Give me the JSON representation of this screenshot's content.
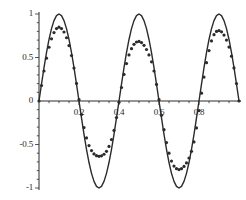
{
  "chart_data": {
    "type": "line",
    "title": "",
    "subtitle": "",
    "xlabel": "",
    "ylabel": "",
    "xlim": [
      0,
      1.0
    ],
    "ylim": [
      -1,
      1
    ],
    "grid": false,
    "legend": null,
    "legend_position": "none",
    "background_color": "#ffffff",
    "axis_color": "#2b2b2b",
    "xticks": [
      0.2,
      0.4,
      0.6,
      0.8
    ],
    "xtick_labels": [
      "0.2",
      "0.4",
      "0.6",
      "0.8"
    ],
    "xticks_minor": [
      0.05,
      0.1,
      0.15,
      0.25,
      0.3,
      0.35,
      0.45,
      0.5,
      0.55,
      0.65,
      0.7,
      0.75,
      0.85,
      0.9,
      0.95
    ],
    "yticks": [
      -1,
      -0.5,
      0,
      0.5,
      1
    ],
    "ytick_labels": [
      "-1",
      "-0.5",
      "0",
      "0.5",
      "1"
    ],
    "yticks_minor": [
      -0.9,
      -0.8,
      -0.7,
      -0.6,
      -0.4,
      -0.3,
      -0.2,
      -0.1,
      0.1,
      0.2,
      0.3,
      0.4,
      0.6,
      0.7,
      0.8,
      0.9
    ],
    "series": [
      {
        "name": "exact",
        "style": "solid",
        "color": "#2b2b2b",
        "line_width": 1.4,
        "description": "sin(4*pi*x), amplitude 1, two full periods over x in [0,1]",
        "x": [
          0,
          0.0125,
          0.025,
          0.0375,
          0.05,
          0.0625,
          0.075,
          0.0875,
          0.1,
          0.1125,
          0.125,
          0.1375,
          0.15,
          0.1625,
          0.175,
          0.1875,
          0.2,
          0.2125,
          0.225,
          0.2375,
          0.25,
          0.2625,
          0.275,
          0.2875,
          0.3,
          0.3125,
          0.325,
          0.3375,
          0.35,
          0.3625,
          0.375,
          0.3875,
          0.4,
          0.4125,
          0.425,
          0.4375,
          0.45,
          0.4625,
          0.475,
          0.4875,
          0.5,
          0.5125,
          0.525,
          0.5375,
          0.55,
          0.5625,
          0.575,
          0.5875,
          0.6,
          0.6125,
          0.625,
          0.6375,
          0.65,
          0.6625,
          0.675,
          0.6875,
          0.7,
          0.7125,
          0.725,
          0.7375,
          0.75,
          0.7625,
          0.775,
          0.7875,
          0.8,
          0.8125,
          0.825,
          0.8375,
          0.85,
          0.8625,
          0.875,
          0.8875,
          0.9,
          0.9125,
          0.925,
          0.9375,
          0.95,
          0.9625,
          0.975,
          0.9875,
          1.0
        ],
        "y": [
          0,
          0.1951,
          0.3827,
          0.5556,
          0.7071,
          0.8315,
          0.9239,
          0.9808,
          1.0,
          0.9808,
          0.9239,
          0.8315,
          0.7071,
          0.5556,
          0.3827,
          0.1951,
          0,
          -0.1951,
          -0.3827,
          -0.5556,
          -0.7071,
          -0.8315,
          -0.9239,
          -0.9808,
          -1.0,
          -0.9808,
          -0.9239,
          -0.8315,
          -0.7071,
          -0.5556,
          -0.3827,
          -0.1951,
          0,
          0.1951,
          0.3827,
          0.5556,
          0.7071,
          0.8315,
          0.9239,
          0.9808,
          1.0,
          0.9808,
          0.9239,
          0.8315,
          0.7071,
          0.5556,
          0.3827,
          0.1951,
          0,
          -0.1951,
          -0.3827,
          -0.5556,
          -0.7071,
          -0.8315,
          -0.9239,
          -0.9808,
          -1.0,
          -0.9808,
          -0.9239,
          -0.8315,
          -0.7071,
          -0.5556,
          -0.3827,
          -0.1951,
          0,
          0.1951,
          0.3827,
          0.5556,
          0.7071,
          0.8315,
          0.9239,
          0.9808,
          1.0,
          0.9808,
          0.9239,
          0.8315,
          0.7071,
          0.5556,
          0.3827,
          0.1951,
          0
        ]
      },
      {
        "name": "approximation",
        "style": "dotted",
        "color": "#2b2b2b",
        "marker_size": 1.6,
        "description": "damped sine approximation, amplitude decreasing: peaks ~0.85 then ~0.67; troughs ~-0.63 then ~-0.78",
        "x": [
          0,
          0.0125,
          0.025,
          0.0375,
          0.05,
          0.0625,
          0.075,
          0.0875,
          0.1,
          0.1125,
          0.125,
          0.1375,
          0.15,
          0.1625,
          0.175,
          0.1875,
          0.2,
          0.2125,
          0.225,
          0.2375,
          0.25,
          0.2625,
          0.275,
          0.2875,
          0.3,
          0.3125,
          0.325,
          0.3375,
          0.35,
          0.3625,
          0.375,
          0.3875,
          0.4,
          0.4125,
          0.425,
          0.4375,
          0.45,
          0.4625,
          0.475,
          0.4875,
          0.5,
          0.5125,
          0.525,
          0.5375,
          0.55,
          0.5625,
          0.575,
          0.5875,
          0.6,
          0.6125,
          0.625,
          0.6375,
          0.65,
          0.6625,
          0.675,
          0.6875,
          0.7,
          0.7125,
          0.725,
          0.7375,
          0.75,
          0.7625,
          0.775,
          0.7875,
          0.8,
          0.8125,
          0.825,
          0.8375,
          0.85,
          0.8625,
          0.875,
          0.8875,
          0.9,
          0.9125,
          0.925,
          0.9375,
          0.95,
          0.9625,
          0.975,
          0.9875,
          1.0
        ],
        "y": [
          0,
          0.178,
          0.345,
          0.492,
          0.618,
          0.715,
          0.787,
          0.833,
          0.848,
          0.833,
          0.793,
          0.727,
          0.637,
          0.523,
          0.378,
          0.202,
          0.015,
          -0.155,
          -0.305,
          -0.425,
          -0.512,
          -0.57,
          -0.608,
          -0.628,
          -0.636,
          -0.63,
          -0.612,
          -0.578,
          -0.522,
          -0.443,
          -0.338,
          -0.19,
          -0.015,
          0.155,
          0.305,
          0.43,
          0.53,
          0.602,
          0.652,
          0.678,
          0.685,
          0.672,
          0.64,
          0.592,
          0.53,
          0.45,
          0.345,
          0.19,
          0.015,
          -0.165,
          -0.33,
          -0.478,
          -0.6,
          -0.69,
          -0.748,
          -0.778,
          -0.788,
          -0.778,
          -0.752,
          -0.712,
          -0.655,
          -0.578,
          -0.47,
          -0.31,
          -0.11,
          0.09,
          0.275,
          0.44,
          0.58,
          0.69,
          0.762,
          0.8,
          0.81,
          0.795,
          0.758,
          0.7,
          0.62,
          0.515,
          0.38,
          0.2,
          0
        ]
      }
    ]
  },
  "axes": {
    "x_axis_name": "horizontal-axis",
    "y_axis_name": "vertical-axis"
  }
}
